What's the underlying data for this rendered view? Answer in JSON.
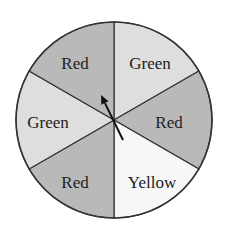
{
  "spinner": {
    "center": [
      114,
      120
    ],
    "radius": 98,
    "sectors": [
      {
        "label": "Green",
        "color": "Green",
        "fill": "#dedede",
        "label_pos": [
          150,
          63
        ]
      },
      {
        "label": "Red",
        "color": "Red",
        "fill": "#b9b9b9",
        "label_pos": [
          169,
          122
        ]
      },
      {
        "label": "Yellow",
        "color": "Yellow",
        "fill": "#f7f7f7",
        "label_pos": [
          152,
          182
        ]
      },
      {
        "label": "Red",
        "color": "Red",
        "fill": "#b9b9b9",
        "label_pos": [
          75,
          182
        ]
      },
      {
        "label": "Green",
        "color": "Green",
        "fill": "#dedede",
        "label_pos": [
          48,
          122
        ]
      },
      {
        "label": "Red",
        "color": "Red",
        "fill": "#b9b9b9",
        "label_pos": [
          75,
          63
        ]
      }
    ],
    "arrow": {
      "from": [
        123,
        140
      ],
      "to": [
        101,
        95
      ],
      "color": "#111111"
    },
    "outline_color": "#333333"
  }
}
